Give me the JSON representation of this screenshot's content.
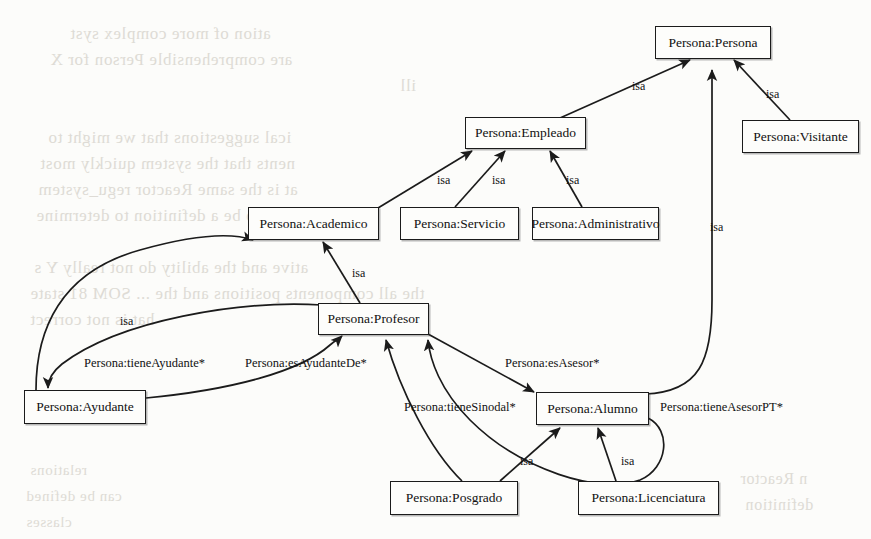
{
  "diagram": {
    "stroke_color": "#1b1b1b",
    "node_fill": "#fdfdfb",
    "background": "#fcfcfa",
    "nodes": [
      {
        "id": "persona",
        "label": "Persona:Persona",
        "x": 655,
        "y": 26,
        "w": 116,
        "h": 33
      },
      {
        "id": "visitante",
        "label": "Persona:Visitante",
        "x": 742,
        "y": 120,
        "w": 117,
        "h": 33
      },
      {
        "id": "empleado",
        "label": "Persona:Empleado",
        "x": 465,
        "y": 117,
        "w": 121,
        "h": 32
      },
      {
        "id": "academico",
        "label": "Persona:Academico",
        "x": 248,
        "y": 207,
        "w": 131,
        "h": 33
      },
      {
        "id": "servicio",
        "label": "Persona:Servicio",
        "x": 400,
        "y": 207,
        "w": 119,
        "h": 33
      },
      {
        "id": "administrativo",
        "label": "Persona:Administrativo",
        "x": 532,
        "y": 207,
        "w": 127,
        "h": 33
      },
      {
        "id": "profesor",
        "label": "Persona:Profesor",
        "x": 318,
        "y": 303,
        "w": 111,
        "h": 32
      },
      {
        "id": "ayudante",
        "label": "Persona:Ayudante",
        "x": 24,
        "y": 390,
        "w": 122,
        "h": 34
      },
      {
        "id": "alumno",
        "label": "Persona:Alumno",
        "x": 536,
        "y": 392,
        "w": 113,
        "h": 33
      },
      {
        "id": "posgrado",
        "label": "Persona:Posgrado",
        "x": 390,
        "y": 481,
        "w": 128,
        "h": 34
      },
      {
        "id": "licenciatura",
        "label": "Persona:Licenciatura",
        "x": 578,
        "y": 481,
        "w": 141,
        "h": 34
      }
    ],
    "edge_labels": [
      {
        "id": "isa-empleado",
        "text": "isa",
        "x": 632,
        "y": 80
      },
      {
        "id": "isa-visitante",
        "text": "isa",
        "x": 766,
        "y": 88
      },
      {
        "id": "isa-academico",
        "text": "isa",
        "x": 437,
        "y": 174
      },
      {
        "id": "isa-servicio",
        "text": "isa",
        "x": 492,
        "y": 174
      },
      {
        "id": "isa-administrativo",
        "text": "isa",
        "x": 566,
        "y": 174
      },
      {
        "id": "isa-alumno-persona",
        "text": "isa",
        "x": 710,
        "y": 221
      },
      {
        "id": "isa-profesor",
        "text": "isa",
        "x": 352,
        "y": 267
      },
      {
        "id": "isa-ayudante",
        "text": "isa",
        "x": 120,
        "y": 315
      },
      {
        "id": "tieneAyudante",
        "text": "Persona:tieneAyudante*",
        "x": 84,
        "y": 357
      },
      {
        "id": "esAyudanteDe",
        "text": "Persona:esAyudanteDe*",
        "x": 245,
        "y": 357
      },
      {
        "id": "esAsesor",
        "text": "Persona:esAsesor*",
        "x": 505,
        "y": 357
      },
      {
        "id": "tieneSinodal",
        "text": "Persona:tieneSinodal*",
        "x": 404,
        "y": 401
      },
      {
        "id": "tieneAsesorPT",
        "text": "Persona:tieneAsesorPT*",
        "x": 660,
        "y": 401
      },
      {
        "id": "isa-posgrado",
        "text": "isa",
        "x": 520,
        "y": 455
      },
      {
        "id": "isa-licenciatura",
        "text": "isa",
        "x": 621,
        "y": 455
      }
    ],
    "background_ghost_text": [
      {
        "text": "ation of more complex syst",
        "x": 70,
        "y": 24,
        "size": 17
      },
      {
        "text": "are comprehensible Person for X",
        "x": 50,
        "y": 50,
        "size": 17
      },
      {
        "text": "ill",
        "x": 400,
        "y": 76,
        "size": 17
      },
      {
        "text": "ical suggestions that we might to",
        "x": 48,
        "y": 128,
        "size": 17
      },
      {
        "text": "nents that the system quickly most",
        "x": 40,
        "y": 154,
        "size": 17
      },
      {
        "text": "at is the same Reactor regu_system",
        "x": 38,
        "y": 180,
        "size": 17
      },
      {
        "text": "are so is to be a definition to determine",
        "x": 36,
        "y": 206,
        "size": 17
      },
      {
        "text": "ative and the ability do not really Y s",
        "x": 34,
        "y": 258,
        "size": 17
      },
      {
        "text": "the all components positions and the ... SOM 81 state",
        "x": 30,
        "y": 284,
        "size": 17
      },
      {
        "text": "hat is not correct",
        "x": 30,
        "y": 310,
        "size": 17
      },
      {
        "text": "cted",
        "x": 24,
        "y": 388,
        "size": 16
      },
      {
        "text": "relations",
        "x": 30,
        "y": 462,
        "size": 15
      },
      {
        "text": "can be defined",
        "x": 26,
        "y": 488,
        "size": 15
      },
      {
        "text": "classes",
        "x": 26,
        "y": 514,
        "size": 15
      },
      {
        "text": "n Reactor",
        "x": 740,
        "y": 470,
        "size": 16
      },
      {
        "text": "definition",
        "x": 745,
        "y": 496,
        "size": 16
      }
    ]
  }
}
